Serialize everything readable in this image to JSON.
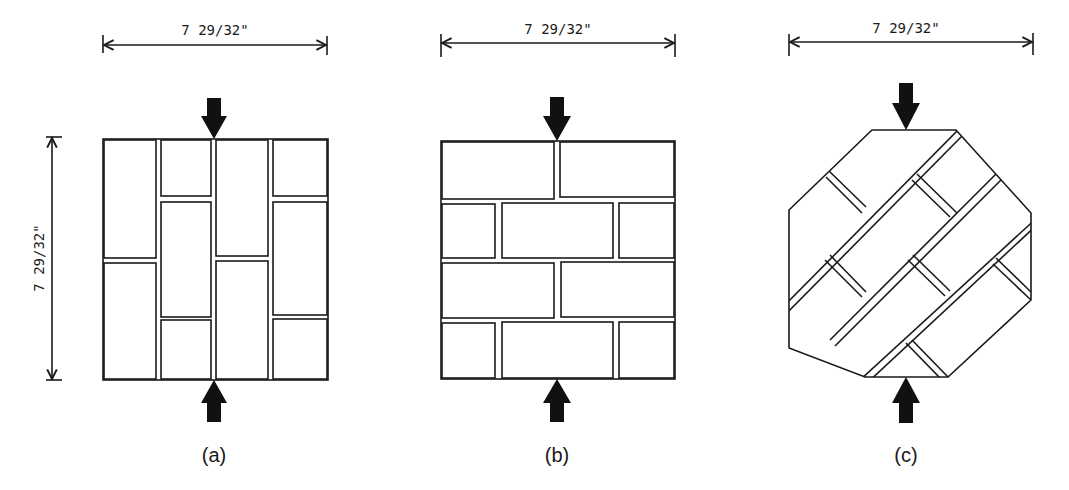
{
  "figure": {
    "panels": [
      {
        "id": "a",
        "caption": "(a)",
        "width_dimension": "7 29/32\"",
        "height_dimension": "7 29/32\"",
        "pattern": "stack-bond vertical bricks (soldier courses, staggered columns)",
        "load": "compressive point loads top and bottom (arrows)"
      },
      {
        "id": "b",
        "caption": "(b)",
        "width_dimension": "7 29/32\"",
        "pattern": "running bond horizontal bricks",
        "load": "compressive point loads top and bottom (arrows)"
      },
      {
        "id": "c",
        "caption": "(c)",
        "width_dimension": "7 29/32\"",
        "pattern": "running bond rotated 45 degrees, octagonal specimen",
        "load": "compressive point loads top and bottom (arrows)"
      }
    ],
    "colors": {
      "line": "#1a1a1a",
      "arrow": "#111111",
      "background": "#ffffff"
    }
  }
}
